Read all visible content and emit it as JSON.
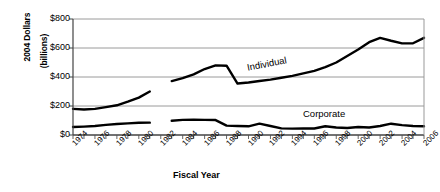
{
  "chart_data": {
    "type": "line",
    "title": "",
    "xlabel": "Fiscal Year",
    "ylabel_line1": "2004 Dollars",
    "ylabel_line2": "(billions)",
    "ylim": [
      0,
      800
    ],
    "ytick_values": [
      0,
      200,
      400,
      600,
      800
    ],
    "ytick_labels": [
      "$0",
      "$200",
      "$400",
      "$600",
      "$800"
    ],
    "grid": "horizontal",
    "legend_position": "inline-annotations",
    "xlim": [
      1974,
      2006
    ],
    "xtick_years": [
      1974,
      1975,
      1976,
      1977,
      1978,
      1979,
      1980,
      1981,
      1982,
      1983,
      1984,
      1985,
      1986,
      1987,
      1988,
      1989,
      1990,
      1991,
      1992,
      1993,
      1994,
      1995,
      1996,
      1997,
      1998,
      1999,
      2000,
      2001,
      2002,
      2003,
      2004,
      2005,
      2006
    ],
    "xtick_labels": [
      "1974",
      "1976",
      "1978",
      "1980",
      "1982",
      "1984",
      "1986",
      "1988",
      "1990",
      "1992",
      "1994",
      "1996",
      "1998",
      "2000",
      "2002",
      "2004",
      "2006"
    ],
    "xtick_labeled_years": [
      1974,
      1976,
      1978,
      1980,
      1982,
      1984,
      1986,
      1988,
      1990,
      1992,
      1994,
      1996,
      1998,
      2000,
      2002,
      2004,
      2006
    ],
    "data_gap_years": [
      1982
    ],
    "series": [
      {
        "name": "Individual",
        "label": "Individual",
        "color": "#000000",
        "segments": [
          {
            "x": [
              1974,
              1975,
              1976,
              1977,
              1978,
              1979,
              1980,
              1981
            ],
            "y": [
              180,
              176,
              180,
              192,
              205,
              230,
              258,
              300
            ]
          },
          {
            "x": [
              1983,
              1984,
              1985,
              1986,
              1987,
              1988,
              1989,
              1990,
              1991,
              1992,
              1993,
              1994,
              1995,
              1996,
              1997,
              1998,
              1999,
              2000,
              2001,
              2002,
              2003,
              2004,
              2005,
              2006
            ],
            "y": [
              372,
              392,
              418,
              455,
              480,
              478,
              355,
              362,
              372,
              382,
              395,
              408,
              425,
              442,
              468,
              500,
              545,
              590,
              640,
              670,
              650,
              632,
              633,
              670,
              700
            ]
          }
        ]
      },
      {
        "name": "Corporate",
        "label": "Corporate",
        "color": "#000000",
        "segments": [
          {
            "x": [
              1974,
              1975,
              1976,
              1977,
              1978,
              1979,
              1980,
              1981
            ],
            "y": [
              55,
              58,
              62,
              70,
              76,
              80,
              84,
              85
            ]
          },
          {
            "x": [
              1983,
              1984,
              1985,
              1986,
              1987,
              1988,
              1989,
              1990,
              1991,
              1992,
              1993,
              1994,
              1995,
              1996,
              1997,
              1998,
              1999,
              2000,
              2001,
              2002,
              2003,
              2004,
              2005,
              2006
            ],
            "y": [
              98,
              104,
              105,
              104,
              103,
              65,
              62,
              60,
              78,
              62,
              46,
              44,
              46,
              45,
              60,
              52,
              48,
              55,
              52,
              62,
              78,
              68,
              62,
              60,
              75
            ]
          }
        ]
      }
    ],
    "annotations": [
      {
        "name": "individual-label",
        "text": "Individual",
        "rotation_deg": -11
      },
      {
        "name": "corporate-label",
        "text": "Corporate",
        "rotation_deg": 0
      }
    ]
  },
  "caption_partial": ""
}
